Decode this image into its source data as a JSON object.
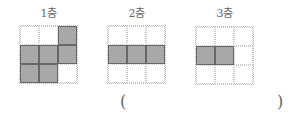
{
  "floors": [
    {
      "label": "1층",
      "grid": [
        [
          0,
          0,
          1
        ],
        [
          1,
          1,
          1
        ],
        [
          1,
          1,
          0
        ]
      ]
    },
    {
      "label": "2층",
      "grid": [
        [
          0,
          0,
          0
        ],
        [
          1,
          1,
          1
        ],
        [
          0,
          0,
          0
        ]
      ]
    },
    {
      "label": "3층",
      "grid": [
        [
          0,
          0,
          0
        ],
        [
          1,
          1,
          0
        ],
        [
          0,
          0,
          0
        ]
      ]
    }
  ],
  "answer": {
    "open": "(",
    "close": ")",
    "value": ""
  },
  "colors": {
    "filled": "#a8a8a8",
    "border": "#666666",
    "dotted": "#c8c8c8"
  }
}
